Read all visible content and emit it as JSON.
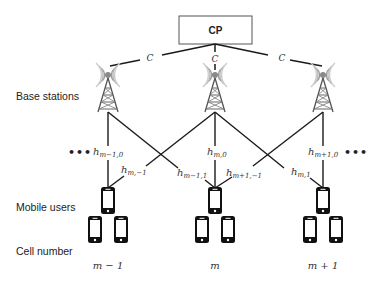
{
  "diagram": {
    "central_processor": {
      "label": "CP"
    },
    "fronthaul": {
      "capacity_label": "C"
    },
    "row_labels": {
      "base_stations": "Base stations",
      "mobile_users": "Mobile users",
      "cell_number": "Cell number"
    },
    "ellipsis": "•••",
    "cells": [
      {
        "id": "m-1",
        "label": "m − 1"
      },
      {
        "id": "m",
        "label": "m"
      },
      {
        "id": "m+1",
        "label": "m + 1"
      }
    ],
    "channels": [
      {
        "base": "h",
        "sub": "m−1,0"
      },
      {
        "base": "h",
        "sub": "m,−1"
      },
      {
        "base": "h",
        "sub": "m,0"
      },
      {
        "base": "h",
        "sub": "m−1,1"
      },
      {
        "base": "h",
        "sub": "m+1,−1"
      },
      {
        "base": "h",
        "sub": "m,1"
      },
      {
        "base": "h",
        "sub": "m+1,0"
      }
    ],
    "icons": {
      "tower": "cell-tower-icon",
      "phone": "smartphone-icon",
      "processor": "cp-box"
    },
    "colors": {
      "line": "#1a1a1a",
      "tower": "#6b6b6b",
      "phone": "#111111"
    }
  }
}
